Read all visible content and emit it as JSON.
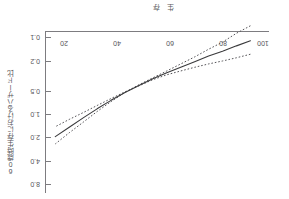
{
  "figure": {
    "title": "生存",
    "orientation_note": "rotated-180"
  },
  "axes": {
    "y_caption": "60歳時生存におけるハザード比",
    "x_ticks": [
      "20",
      "40",
      "60",
      "80",
      "100"
    ],
    "y_ticks": [
      "0.1",
      "0.2",
      "0.5",
      "1.0",
      "2.0",
      "4.0",
      "8.0"
    ]
  },
  "chart_data": {
    "type": "line",
    "title": "生存",
    "xlabel": "",
    "ylabel": "60歳時生存におけるハザード比",
    "xlim": [
      12,
      108
    ],
    "ylim": [
      0.1,
      8.0
    ],
    "yscale": "log",
    "grid": false,
    "legend": null,
    "x_tick_values": [
      20,
      40,
      60,
      80,
      100
    ],
    "y_tick_values": [
      0.1,
      0.2,
      0.5,
      1.0,
      2.0,
      4.0,
      8.0
    ],
    "series": [
      {
        "name": "ハザード比 (点推定)",
        "style": "solid",
        "color": "#3a3a3c",
        "x": [
          20,
          26,
          32,
          38,
          44,
          50,
          56,
          62,
          68,
          74,
          80,
          86,
          92,
          98,
          104
        ],
        "y": [
          0.26,
          0.3,
          0.35,
          0.4,
          0.47,
          0.55,
          0.64,
          0.76,
          0.92,
          1.12,
          1.4,
          1.78,
          2.3,
          3.0,
          3.9
        ]
      },
      {
        "name": "95%信頼区間 上限",
        "style": "dotted",
        "color": "#57565a",
        "x": [
          20,
          26,
          32,
          38,
          44,
          50,
          56,
          62,
          68,
          74,
          80,
          86,
          92,
          98,
          104
        ],
        "y": [
          0.17,
          0.21,
          0.27,
          0.33,
          0.41,
          0.5,
          0.61,
          0.74,
          0.9,
          1.12,
          1.45,
          1.92,
          2.6,
          3.5,
          4.8
        ]
      },
      {
        "name": "95%信頼区間 下限",
        "style": "dotted",
        "color": "#57565a",
        "x": [
          20,
          26,
          32,
          38,
          44,
          50,
          56,
          62,
          68,
          74,
          80,
          86,
          92,
          98,
          104
        ],
        "y": [
          0.38,
          0.42,
          0.46,
          0.5,
          0.55,
          0.61,
          0.68,
          0.78,
          0.93,
          1.1,
          1.33,
          1.62,
          1.98,
          2.4,
          2.95
        ]
      }
    ]
  }
}
